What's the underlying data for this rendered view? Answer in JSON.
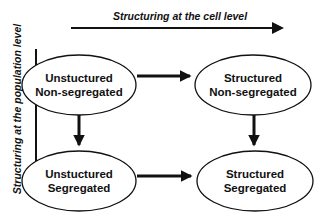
{
  "axes": {
    "horizontal_label": "Structuring at the cell level",
    "vertical_label": "Structuring at the population level"
  },
  "nodes": [
    {
      "id": "tl",
      "line1": "Unstuctured",
      "line2": "Non-segregated"
    },
    {
      "id": "tr",
      "line1": "Structured",
      "line2": "Non-segregated"
    },
    {
      "id": "bl",
      "line1": "Unstuctured",
      "line2": "Segregated"
    },
    {
      "id": "br",
      "line1": "Structured",
      "line2": "Segregated"
    }
  ],
  "edges": [
    {
      "from": "tl",
      "to": "tr"
    },
    {
      "from": "tl",
      "to": "bl"
    },
    {
      "from": "tr",
      "to": "br"
    },
    {
      "from": "bl",
      "to": "br"
    }
  ],
  "colors": {
    "stroke": "#111111",
    "background": "#ffffff"
  }
}
